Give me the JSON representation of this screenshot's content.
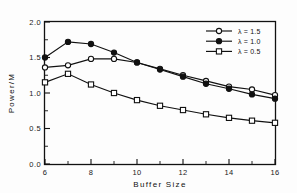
{
  "chart_data": {
    "type": "line",
    "title": "",
    "xlabel": "Buffer Size",
    "ylabel": "Power/M",
    "xlim": [
      6,
      16
    ],
    "ylim": [
      0.0,
      2.0
    ],
    "grid": false,
    "legend_position": "top-right",
    "x": [
      6,
      7,
      8,
      9,
      10,
      11,
      12,
      13,
      14,
      15,
      16
    ],
    "xticks": [
      "6",
      "8",
      "10",
      "12",
      "14",
      "16"
    ],
    "xtick_values": [
      6,
      8,
      10,
      12,
      14,
      16
    ],
    "xticks_minor": [
      7,
      9,
      11,
      13,
      15
    ],
    "yticks": [
      "0.0",
      "0.5",
      "1.0",
      "1.5",
      "2.0"
    ],
    "ytick_values": [
      0.0,
      0.5,
      1.0,
      1.5,
      2.0
    ],
    "yticks_minor": [
      0.25,
      0.75,
      1.25,
      1.75
    ],
    "series": [
      {
        "name": "λ = 1.5",
        "marker": "open-circle",
        "values": [
          1.36,
          1.39,
          1.48,
          1.48,
          1.43,
          1.34,
          1.25,
          1.17,
          1.09,
          1.05,
          0.97
        ]
      },
      {
        "name": "λ = 1.0",
        "marker": "filled-circle",
        "values": [
          1.5,
          1.72,
          1.69,
          1.57,
          1.43,
          1.33,
          1.23,
          1.13,
          1.06,
          0.98,
          0.92
        ]
      },
      {
        "name": "λ = 0.5",
        "marker": "open-square",
        "values": [
          1.15,
          1.27,
          1.12,
          1.0,
          0.9,
          0.82,
          0.76,
          0.7,
          0.65,
          0.61,
          0.58
        ]
      }
    ]
  },
  "legend": {
    "entries": [
      {
        "label": "λ = 1.5",
        "marker": "open-circle"
      },
      {
        "label": "λ = 1.0",
        "marker": "filled-circle"
      },
      {
        "label": "λ = 0.5",
        "marker": "open-square"
      }
    ]
  },
  "colors": {
    "ink": "#111111",
    "background": "#ffffff",
    "marker_fill": "#ffffff"
  }
}
